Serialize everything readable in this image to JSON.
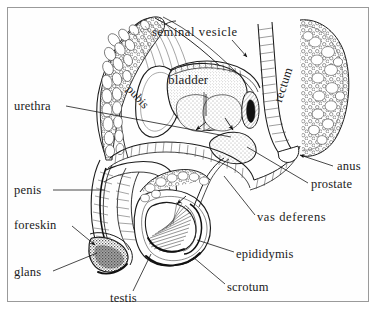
{
  "figure": {
    "kind": "anatomical-diagram",
    "style": "black and white engraving line art",
    "frame_color": "#9a9a9a",
    "background_color": "#ffffff",
    "ink_color": "#1b1b1b"
  },
  "labels": {
    "seminal_vesicle": "seminal  vesicle",
    "bladder": "bladder",
    "rectum": "rectum",
    "pubis": "pubis",
    "urethra": "urethra",
    "anus": "anus",
    "prostate": "prostate",
    "vas_deferens": "vas  deferens",
    "penis": "penis",
    "foreskin": "foreskin",
    "glans": "glans",
    "testis": "testis",
    "epididymis": "epididymis",
    "scrotum": "scrotum"
  },
  "leader_lines": [
    {
      "label": "seminal_vesicle",
      "style": "arrow",
      "from": [
        232,
        40
      ],
      "to": [
        246,
        56
      ]
    },
    {
      "label": "urethra",
      "style": "plain",
      "from": [
        66,
        106
      ],
      "to": [
        231,
        137
      ]
    },
    {
      "label": "anus",
      "style": "arrow",
      "from": [
        333,
        165
      ],
      "to": [
        299,
        155
      ]
    },
    {
      "label": "prostate",
      "style": "plain",
      "from": [
        308,
        183
      ],
      "to": [
        247,
        147
      ]
    },
    {
      "label": "vas_deferens",
      "style": "plain",
      "from": [
        255,
        216
      ],
      "to": [
        224,
        177
      ]
    },
    {
      "label": "penis",
      "style": "plain",
      "from": [
        52,
        190
      ],
      "to": [
        103,
        190
      ]
    },
    {
      "label": "foreskin",
      "style": "arrow",
      "from": [
        71,
        225
      ],
      "to": [
        96,
        246
      ]
    },
    {
      "label": "glans",
      "style": "plain",
      "from": [
        52,
        272
      ],
      "to": [
        96,
        254
      ]
    },
    {
      "label": "testis",
      "style": "plain",
      "from": [
        133,
        292
      ],
      "to": [
        150,
        255
      ]
    },
    {
      "label": "epididymis",
      "style": "plain",
      "from": [
        234,
        252
      ],
      "to": [
        196,
        240
      ]
    },
    {
      "label": "scrotum",
      "style": "plain",
      "from": [
        225,
        285
      ],
      "to": [
        192,
        258
      ]
    }
  ]
}
